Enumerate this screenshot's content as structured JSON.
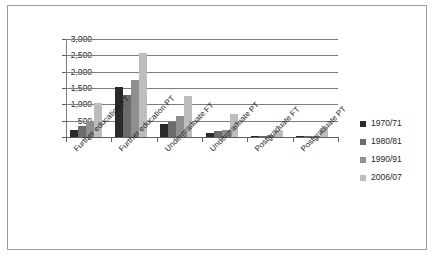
{
  "chart_data": {
    "type": "bar",
    "title": "",
    "subtitle": "",
    "xlabel": "",
    "ylabel": "",
    "ylim": [
      0,
      3000
    ],
    "ytick_values": [
      0,
      500,
      1000,
      1500,
      2000,
      2500,
      3000
    ],
    "ytick_labels": [
      "0",
      "500",
      "1,000",
      "1,500",
      "2,000",
      "2,500",
      "3,000"
    ],
    "grid": true,
    "legend_position": "right",
    "categories": [
      "Further education FT",
      "Further education PT",
      "Undergraduate FT",
      "Undergraduate PT",
      "Postgraduate FT",
      "Postgraduate PT"
    ],
    "series": [
      {
        "name": "1970/71",
        "color": "#2a2a2a",
        "values": [
          210,
          1520,
          400,
          120,
          10,
          5
        ]
      },
      {
        "name": "1980/81",
        "color": "#6b6b6b",
        "values": [
          340,
          1300,
          470,
          190,
          20,
          15
        ]
      },
      {
        "name": "1990/91",
        "color": "#8f8f8f",
        "values": [
          490,
          1740,
          630,
          230,
          50,
          40
        ]
      },
      {
        "name": "2006/07",
        "color": "#bdbdbd",
        "values": [
          1030,
          2570,
          1250,
          700,
          200,
          280
        ]
      }
    ]
  },
  "legend": {
    "entries": [
      {
        "label": "1970/71",
        "color": "#2a2a2a"
      },
      {
        "label": "1980/81",
        "color": "#6b6b6b"
      },
      {
        "label": "1990/91",
        "color": "#8f8f8f"
      },
      {
        "label": "2006/07",
        "color": "#bdbdbd"
      }
    ]
  }
}
